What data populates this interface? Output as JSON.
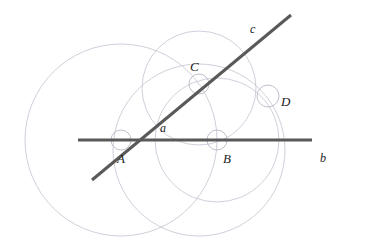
{
  "diagram": {
    "canvas": {
      "width": 365,
      "height": 248,
      "background": "#ffffff"
    },
    "colors": {
      "line_stroke": "#595959",
      "circle_stroke": "#c9c9d6",
      "small_circle_stroke": "#b9b9c8",
      "label_fill": "#1a1a1a"
    },
    "lines": [
      {
        "id": "line-b",
        "label": "b",
        "label_x": 320,
        "label_y": 162,
        "x1": 78,
        "y1": 140,
        "x2": 312,
        "y2": 140,
        "stroke_width": 3
      },
      {
        "id": "line-c",
        "label": "c",
        "label_x": 250,
        "label_y": 33,
        "x1": 92,
        "y1": 180,
        "x2": 291,
        "y2": 15,
        "stroke_width": 3
      }
    ],
    "region_label": {
      "id": "region-a",
      "label": "a",
      "label_x": 160,
      "label_y": 132
    },
    "points": [
      {
        "id": "point-A",
        "label": "A",
        "cx": 121,
        "cy": 140,
        "r": 10,
        "label_x": 117,
        "label_y": 163
      },
      {
        "id": "point-B",
        "label": "B",
        "cx": 217,
        "cy": 140,
        "r": 10,
        "label_x": 223,
        "label_y": 163
      },
      {
        "id": "point-C",
        "label": "C",
        "cx": 199,
        "cy": 84,
        "r": 10,
        "label_x": 190,
        "label_y": 71
      },
      {
        "id": "point-D",
        "label": "D",
        "cx": 268,
        "cy": 96,
        "r": 11,
        "label_x": 281,
        "label_y": 106
      }
    ],
    "construction_circles": [
      {
        "id": "circle-big-A",
        "cx": 121,
        "cy": 140,
        "r": 96
      },
      {
        "id": "circle-mid-C",
        "cx": 199,
        "cy": 88,
        "r": 57
      },
      {
        "id": "circle-mid-B",
        "cx": 217,
        "cy": 140,
        "r": 62
      },
      {
        "id": "circle-low-mid",
        "cx": 199,
        "cy": 150,
        "r": 86
      }
    ]
  }
}
